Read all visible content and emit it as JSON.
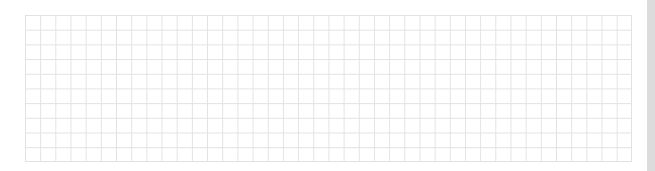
{
  "grid": {
    "columns": 40,
    "rows": 10,
    "line_color": "#e2e2e2",
    "background_color": "#ffffff"
  },
  "scrollbar": {
    "orientation": "vertical",
    "track_color": "#e3e3e3"
  }
}
